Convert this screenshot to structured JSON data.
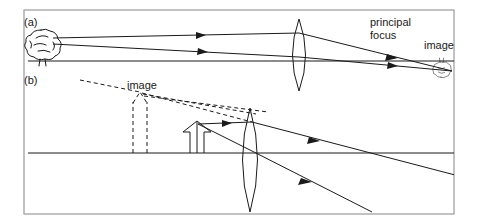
{
  "figure": {
    "kind": "optics-ray-diagram",
    "width": 477,
    "height": 224,
    "background_color": "#ffffff",
    "ink_color": "#1a1a1a",
    "frame_color": "#9a9a9a"
  },
  "panels": [
    {
      "tag": "(a)",
      "tag_x": 24,
      "tag_y": 26,
      "description": "real inverted image formed by converging lens",
      "axis": {
        "x1": 28,
        "y1": 61,
        "x2": 455,
        "y2": 61
      },
      "lens": {
        "cx": 299,
        "cy": 55,
        "half_height": 36,
        "bulge": 13
      },
      "object": {
        "type": "tree",
        "cx": 41,
        "cy": 44,
        "inverted": false
      },
      "image": {
        "type": "tree",
        "cx": 441,
        "cy": 69,
        "inverted": true
      },
      "labels": [
        {
          "text": "principal",
          "x": 370,
          "y": 26
        },
        {
          "text": "focus",
          "x": 370,
          "y": 38
        },
        {
          "text": "image",
          "x": 424,
          "y": 49
        }
      ],
      "rays": [
        {
          "from_x": 53,
          "from_y": 38,
          "to_x": 299,
          "to_y": 33,
          "after_x": 452,
          "after_y": 71,
          "arrow_t": 0.62
        },
        {
          "from_x": 53,
          "from_y": 44,
          "to_x": 299,
          "to_y": 57,
          "after_x": 452,
          "after_y": 71,
          "arrow_t": 0.62
        }
      ]
    },
    {
      "tag": "(b)",
      "tag_x": 24,
      "tag_y": 84,
      "description": "magnified virtual image formed by converging lens",
      "axis": {
        "x1": 28,
        "y1": 153,
        "x2": 455,
        "y2": 153
      },
      "lens": {
        "cx": 250,
        "cy": 160,
        "half_height": 52,
        "bulge": 14
      },
      "object": {
        "type": "arrow-up",
        "x": 195,
        "base_y": 153,
        "tip_y": 122,
        "label": "object arrow"
      },
      "virtual_image": {
        "type": "arrow-up-dashed",
        "x": 140,
        "base_y": 153,
        "tip_y": 92,
        "label": "virtual image arrow"
      },
      "labels": [
        {
          "text": "image",
          "x": 127,
          "y": 89
        }
      ],
      "rays": [
        {
          "from_x": 198,
          "from_y": 124,
          "to_x": 250,
          "to_y": 122,
          "after_x": 455,
          "after_y": 172,
          "arrow_t": 0.55
        },
        {
          "from_x": 198,
          "from_y": 124,
          "to_x": 250,
          "to_y": 150,
          "after_x": 372,
          "after_y": 212,
          "arrow_t": 0.6
        }
      ],
      "dashed_extensions": [
        {
          "x1": 80,
          "y1": 80,
          "x2": 140,
          "y2": 92
        },
        {
          "x1": 140,
          "y1": 92,
          "x2": 250,
          "y2": 122
        },
        {
          "x1": 140,
          "y1": 92,
          "x2": 250,
          "y2": 112
        }
      ]
    }
  ]
}
